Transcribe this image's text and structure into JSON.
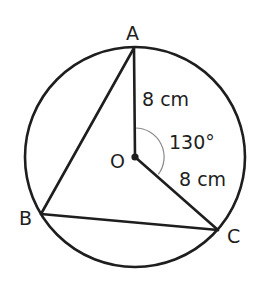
{
  "diagram": {
    "type": "circle-geometry",
    "circle": {
      "center_label": "O",
      "cx": 135,
      "cy": 157,
      "r": 110
    },
    "points": {
      "A": {
        "label": "A",
        "x": 134,
        "y": 48
      },
      "B": {
        "label": "B",
        "x": 41,
        "y": 214
      },
      "C": {
        "label": "C",
        "x": 218,
        "y": 230
      },
      "O": {
        "label": "O",
        "x": 135,
        "y": 157
      }
    },
    "segments": [
      "AB",
      "BC",
      "OA",
      "OC"
    ],
    "labels": {
      "point_a": "A",
      "point_b": "B",
      "point_c": "C",
      "point_o": "O",
      "radius_oa": "8 cm",
      "radius_oc": "8 cm",
      "angle_aoc": "130°"
    },
    "measurements": {
      "OA_cm": 8,
      "OC_cm": 8,
      "angle_AOC_deg": 130
    }
  }
}
